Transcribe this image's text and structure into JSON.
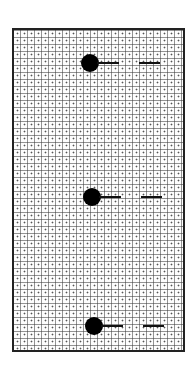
{
  "diagram": {
    "type": "grid-board-with-markers",
    "grid": {
      "cell_px": 7,
      "columns": 24,
      "rows": 46,
      "line_style": "dotted",
      "center_dots": true
    },
    "colors": {
      "background": "#ffffff",
      "border": "#222222",
      "grid": "#555555",
      "marker": "#000000"
    },
    "markers": [
      {
        "id": "top",
        "shape": "filled-circle-with-line-and-dash",
        "cx": 90,
        "cy": 63
      },
      {
        "id": "middle",
        "shape": "filled-circle-with-line-and-dash",
        "cx": 92,
        "cy": 197
      },
      {
        "id": "bottom",
        "shape": "filled-circle-with-line-and-dash",
        "cx": 94,
        "cy": 326
      }
    ]
  }
}
